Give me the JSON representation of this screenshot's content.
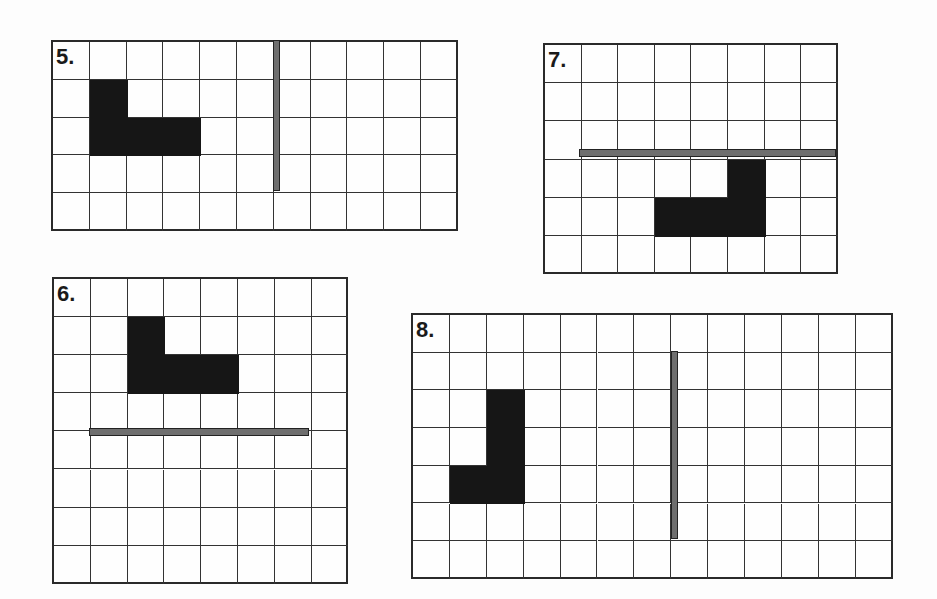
{
  "colors": {
    "grid_line": "#333333",
    "shape": "#161616",
    "mirror": "#6e6e6e",
    "background": "#fdfdfd"
  },
  "problems": [
    {
      "number": "5.",
      "left": 51,
      "top": 40,
      "cols": 11,
      "rows": 5,
      "cell_w": 36.8,
      "cell_h": 37.8,
      "shape_cells": [
        [
          1,
          1
        ],
        [
          1,
          2
        ],
        [
          2,
          2
        ],
        [
          3,
          2
        ]
      ],
      "mirror": {
        "orientation": "vertical",
        "x": 273,
        "y": 40,
        "length": 151,
        "thickness": 7
      }
    },
    {
      "number": "7.",
      "left": 543,
      "top": 43,
      "cols": 8,
      "rows": 6,
      "cell_w": 36.6,
      "cell_h": 38.2,
      "shape_cells": [
        [
          5,
          3
        ],
        [
          3,
          4
        ],
        [
          4,
          4
        ],
        [
          5,
          4
        ]
      ],
      "mirror": {
        "orientation": "horizontal",
        "x": 579,
        "y": 149,
        "length": 257,
        "thickness": 8
      }
    },
    {
      "number": "6.",
      "left": 52,
      "top": 277,
      "cols": 8,
      "rows": 8,
      "cell_w": 36.8,
      "cell_h": 38.1,
      "shape_cells": [
        [
          2,
          1
        ],
        [
          2,
          2
        ],
        [
          3,
          2
        ],
        [
          4,
          2
        ]
      ],
      "mirror": {
        "orientation": "horizontal",
        "x": 89,
        "y": 428,
        "length": 220,
        "thickness": 8
      }
    },
    {
      "number": "8.",
      "left": 411,
      "top": 313,
      "cols": 13,
      "rows": 7,
      "cell_w": 36.9,
      "cell_h": 37.7,
      "shape_cells": [
        [
          2,
          2
        ],
        [
          2,
          3
        ],
        [
          1,
          4
        ],
        [
          2,
          4
        ]
      ],
      "mirror": {
        "orientation": "vertical",
        "x": 671,
        "y": 351,
        "length": 188,
        "thickness": 7
      }
    }
  ]
}
